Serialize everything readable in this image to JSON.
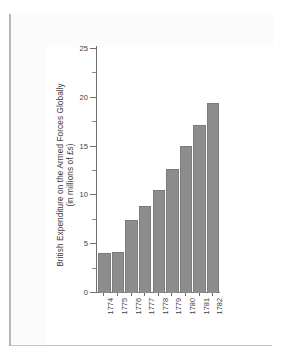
{
  "chart_data": {
    "type": "bar",
    "title": "",
    "xlabel": "",
    "ylabel": "British Expenditure on the Armed Forces Globally (in millions of £s)",
    "ylabel_line1": "British Expenditure on the Armed Forces Globally",
    "ylabel_line2": "(in millions of £s)",
    "categories": [
      "1774",
      "1775",
      "1776",
      "1777",
      "1778",
      "1779",
      "1780",
      "1781",
      "1782"
    ],
    "values": [
      4.0,
      4.1,
      7.4,
      8.8,
      10.5,
      12.6,
      15.0,
      17.1,
      19.4
    ],
    "ylim": [
      0,
      25
    ],
    "y_ticks_major": [
      "0",
      "5",
      "10",
      "15",
      "20",
      "25"
    ],
    "y_tick_major_values": [
      0,
      5,
      10,
      15,
      20,
      25
    ],
    "y_tick_minor_values": [
      2.5,
      7.5,
      12.5,
      17.5,
      22.5
    ],
    "grid": false,
    "legend": false,
    "bar_color": "#8d8d8d",
    "axis_color": "#6e6e6e",
    "text_color": "#3d3d3d",
    "background_color": "#ffffff"
  },
  "page": {
    "sheet_color": "#fbfbfc",
    "plot_area_color": "#ffffff",
    "shadow_color": "#9a9a9a"
  }
}
